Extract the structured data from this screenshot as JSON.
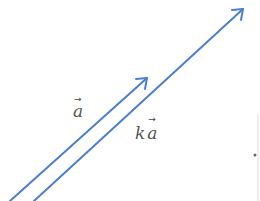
{
  "diagram": {
    "title": "",
    "colors": {
      "vector": "#4a7fd0",
      "label": "#555555",
      "edge": "#cccccc"
    },
    "vectors": [
      {
        "name": "a",
        "label": "a",
        "start": [
          10,
          201
        ],
        "end": [
          147,
          78
        ]
      },
      {
        "name": "ka",
        "label": "a",
        "scalar": "k",
        "start": [
          34,
          201
        ],
        "end": [
          243,
          9
        ]
      }
    ],
    "labels": {
      "a": {
        "text": "a",
        "arrow": "→"
      },
      "ka": {
        "scalar": "k",
        "text": "a",
        "arrow": "→"
      }
    }
  }
}
